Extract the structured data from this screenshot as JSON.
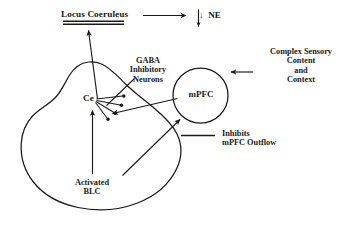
{
  "figure": {
    "type": "neuroanatomical-schematic",
    "background_color": "#ffffff",
    "stroke_color": "#1a1a1a"
  },
  "labels": {
    "locus_coeruleus": "Locus Coeruleus",
    "ne": "↓  NE",
    "gaba_neurons": "GABA\nInhibitory\nNeurons",
    "ce": "Ce",
    "mpfc": "mPFC",
    "complex_sensory": "Complex Sensory\nContent\nand\nContext",
    "inhibits_mpfc_outflow": "Inhibits\nmPFC Outflow",
    "activated_blc": "Activated\nBLC"
  },
  "structures": {
    "amygdala_outline": "pear-shaped closed contour",
    "mpfc_circle": "circle",
    "gaba_terminals_count": 4,
    "locus_coeruleus_underline": "double horizontal rule"
  },
  "connections": [
    {
      "from": "Locus Coeruleus",
      "to": "NE",
      "type": "arrow",
      "direction": "right"
    },
    {
      "from": "Ce",
      "to": "Locus Coeruleus",
      "type": "arrow",
      "direction": "up"
    },
    {
      "from": "Complex Sensory Content and Context",
      "to": "mPFC",
      "type": "arrow",
      "direction": "left"
    },
    {
      "from": "mPFC",
      "to": "Ce",
      "type": "arrow",
      "direction": "left"
    },
    {
      "from": "Activated BLC",
      "to": "Ce",
      "type": "arrow",
      "direction": "up"
    },
    {
      "from": "Activated BLC",
      "to": "mPFC",
      "type": "arrow",
      "direction": "upper-right"
    },
    {
      "from": "GABA Inhibitory Neurons",
      "to": "terminals",
      "type": "pointer-line"
    },
    {
      "from": "legend-key",
      "to": "Inhibits mPFC Outflow",
      "type": "legend-line"
    }
  ]
}
